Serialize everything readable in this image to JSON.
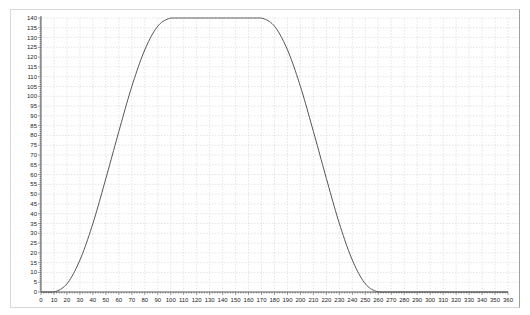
{
  "chart_data": {
    "type": "line",
    "title": "",
    "xlabel": "",
    "ylabel": "",
    "xlim": [
      0,
      360
    ],
    "ylim": [
      0,
      140
    ],
    "x_ticks": [
      0,
      10,
      20,
      30,
      40,
      50,
      60,
      70,
      80,
      90,
      100,
      110,
      120,
      130,
      140,
      150,
      160,
      170,
      180,
      190,
      200,
      210,
      220,
      230,
      240,
      250,
      260,
      270,
      280,
      290,
      300,
      310,
      320,
      330,
      340,
      350,
      360
    ],
    "y_ticks": [
      0,
      5,
      10,
      15,
      20,
      25,
      30,
      35,
      40,
      45,
      50,
      55,
      60,
      65,
      70,
      75,
      80,
      85,
      90,
      95,
      100,
      105,
      110,
      115,
      120,
      125,
      130,
      135,
      140
    ],
    "grid": true,
    "legend": null,
    "series": [
      {
        "name": "profile",
        "color": "#555555",
        "x": [
          0,
          10,
          20,
          30,
          40,
          50,
          60,
          70,
          80,
          90,
          100,
          110,
          120,
          130,
          140,
          150,
          160,
          170,
          180,
          190,
          200,
          210,
          220,
          230,
          240,
          250,
          260,
          270,
          280,
          290,
          300,
          310,
          320,
          330,
          340,
          350,
          360
        ],
        "values": [
          0,
          0,
          4.2,
          16.3,
          35,
          58,
          82,
          105,
          123.7,
          135.8,
          140,
          140,
          140,
          140,
          140,
          140,
          140,
          140,
          135.8,
          123.7,
          105,
          82,
          58,
          35,
          16.3,
          4.2,
          0,
          0,
          0,
          0,
          0,
          0,
          0,
          0,
          0,
          0,
          0
        ]
      }
    ]
  },
  "colors": {
    "background": "#ffffff",
    "grid": "#d4d4d4",
    "axis": "#333333",
    "line": "#555555"
  }
}
